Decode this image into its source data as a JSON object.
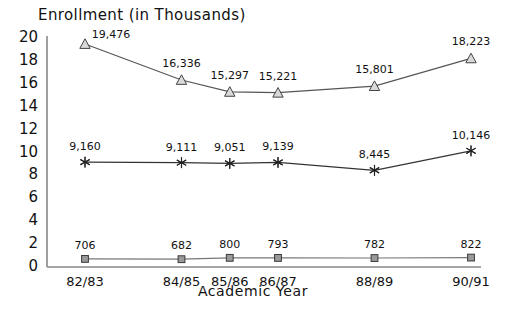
{
  "chart_data": {
    "type": "line",
    "title": "Enrollment (in Thousands)",
    "xlabel": "Academic Year",
    "ylabel": "",
    "categories": [
      "82/83",
      "84/85",
      "85/86",
      "86/87",
      "88/89",
      "90/91"
    ],
    "x_positions": [
      82,
      84,
      85,
      86,
      88,
      90
    ],
    "ylim": [
      0,
      20
    ],
    "ytick_labels": [
      "20",
      "18",
      "16",
      "14",
      "12",
      "10",
      "8",
      "6",
      "4",
      "2",
      "0"
    ],
    "ytick_values": [
      20,
      18,
      16,
      14,
      12,
      10,
      8,
      6,
      4,
      2,
      0
    ],
    "grid": false,
    "legend": "none",
    "units": "thousands",
    "series": [
      {
        "name": "series-triangle",
        "marker": "triangle",
        "color": "#555555",
        "values": [
          19476,
          16336,
          15297,
          15221,
          15801,
          18223
        ],
        "labels": [
          "19,476",
          "16,336",
          "15,297",
          "15,221",
          "15,801",
          "18,223"
        ]
      },
      {
        "name": "series-asterisk",
        "marker": "asterisk",
        "color": "#333333",
        "values": [
          9160,
          9111,
          9051,
          9139,
          8445,
          10146
        ],
        "labels": [
          "9,160",
          "9,111",
          "9,051",
          "9,139",
          "8,445",
          "10,146"
        ]
      },
      {
        "name": "series-square",
        "marker": "square",
        "color": "#777777",
        "values": [
          706,
          682,
          800,
          793,
          782,
          822
        ],
        "labels": [
          "706",
          "682",
          "800",
          "793",
          "782",
          "822"
        ]
      }
    ]
  },
  "axis": {
    "line_color": "#888888"
  }
}
